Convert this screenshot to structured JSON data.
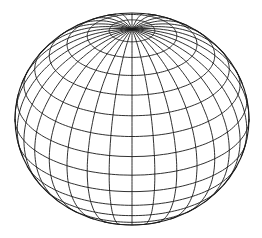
{
  "figure": {
    "background": "#ffffff",
    "line_color": "#1a1a1a",
    "center": [
      132,
      119
    ],
    "radius_x": 117,
    "radius_y": 106,
    "tilt_deg": 32,
    "latitude_rings": 16,
    "meridians": 32
  }
}
